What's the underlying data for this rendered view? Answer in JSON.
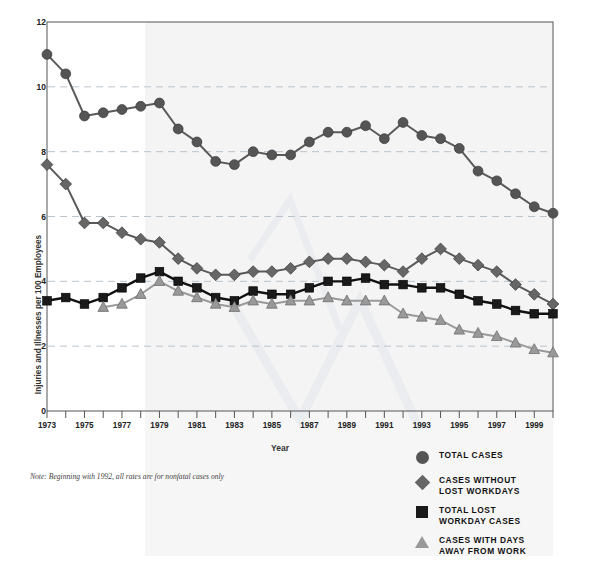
{
  "chart_data": {
    "type": "line",
    "title": "",
    "xlabel": "Year",
    "ylabel": "Injuries and Illnesses per 100 Employees",
    "ylim": [
      0,
      12
    ],
    "yticks": [
      0,
      2,
      4,
      6,
      8,
      10,
      12
    ],
    "xlim": [
      1973,
      2000
    ],
    "xticks": [
      1973,
      1975,
      1977,
      1979,
      1981,
      1983,
      1985,
      1987,
      1989,
      1991,
      1993,
      1995,
      1997,
      1999
    ],
    "grid": "horizontal-dashed",
    "legend_position": "below-right",
    "x": [
      1973,
      1974,
      1975,
      1976,
      1977,
      1978,
      1979,
      1980,
      1981,
      1982,
      1983,
      1984,
      1985,
      1986,
      1987,
      1988,
      1989,
      1990,
      1991,
      1992,
      1993,
      1994,
      1995,
      1996,
      1997,
      1998,
      1999,
      2000
    ],
    "series": [
      {
        "name": "TOTAL CASES",
        "marker": "circle",
        "color": "#555555",
        "values": [
          11.0,
          10.4,
          9.1,
          9.2,
          9.3,
          9.4,
          9.5,
          8.7,
          8.3,
          7.7,
          7.6,
          8.0,
          7.9,
          7.9,
          8.3,
          8.6,
          8.6,
          8.8,
          8.4,
          8.9,
          8.5,
          8.4,
          8.1,
          7.4,
          7.1,
          6.7,
          6.3,
          6.1
        ]
      },
      {
        "name": "CASES WITHOUT LOST WORKDAYS",
        "marker": "diamond",
        "color": "#666666",
        "values": [
          7.6,
          7.0,
          5.8,
          5.8,
          5.5,
          5.3,
          5.2,
          4.7,
          4.4,
          4.2,
          4.2,
          4.3,
          4.3,
          4.4,
          4.6,
          4.7,
          4.7,
          4.6,
          4.5,
          4.3,
          4.7,
          5.0,
          4.7,
          4.5,
          4.3,
          3.9,
          3.6,
          3.3
        ]
      },
      {
        "name": "TOTAL LOST WORKDAY CASES",
        "marker": "square",
        "color": "#1a1a1a",
        "values": [
          3.4,
          3.5,
          3.3,
          3.5,
          3.8,
          4.1,
          4.3,
          4.0,
          3.8,
          3.5,
          3.4,
          3.7,
          3.6,
          3.6,
          3.8,
          4.0,
          4.0,
          4.1,
          3.9,
          3.9,
          3.8,
          3.8,
          3.6,
          3.4,
          3.3,
          3.1,
          3.0,
          3.0
        ]
      },
      {
        "name": "CASES WITH DAYS AWAY FROM WORK",
        "marker": "triangle",
        "color": "#999999",
        "values": [
          null,
          null,
          null,
          3.2,
          3.3,
          3.6,
          4.0,
          3.7,
          3.5,
          3.3,
          3.2,
          3.4,
          3.3,
          3.4,
          3.4,
          3.5,
          3.4,
          3.4,
          3.4,
          3.0,
          2.9,
          2.8,
          2.5,
          2.4,
          2.3,
          2.1,
          1.9,
          1.8
        ]
      }
    ]
  },
  "axis": {
    "ylabel": "Injuries and Illnesses per 100 Employees",
    "xlabel": "Year",
    "yticks": [
      "0",
      "2",
      "4",
      "6",
      "8",
      "10",
      "12"
    ],
    "xticks": [
      "1973",
      "1975",
      "1977",
      "1979",
      "1981",
      "1983",
      "1985",
      "1987",
      "1989",
      "1991",
      "1993",
      "1995",
      "1997",
      "1999"
    ]
  },
  "note": "Note: Beginning with 1992, all rates are for nonfatal cases only",
  "legend": {
    "items": [
      {
        "label": "TOTAL CASES",
        "symbol": "circle-icon",
        "color": "#555555"
      },
      {
        "label": "CASES WITHOUT\nLOST WORKDAYS",
        "line1": "CASES WITHOUT",
        "line2": "LOST WORKDAYS",
        "symbol": "diamond-icon",
        "color": "#666666"
      },
      {
        "label": "TOTAL LOST\nWORKDAY CASES",
        "line1": "TOTAL LOST",
        "line2": "WORKDAY CASES",
        "symbol": "square-icon",
        "color": "#1a1a1a"
      },
      {
        "label": "CASES WITH DAYS\nAWAY FROM WORK",
        "line1": "CASES WITH DAYS",
        "line2": "AWAY FROM WORK",
        "symbol": "triangle-icon",
        "color": "#999999"
      }
    ]
  }
}
